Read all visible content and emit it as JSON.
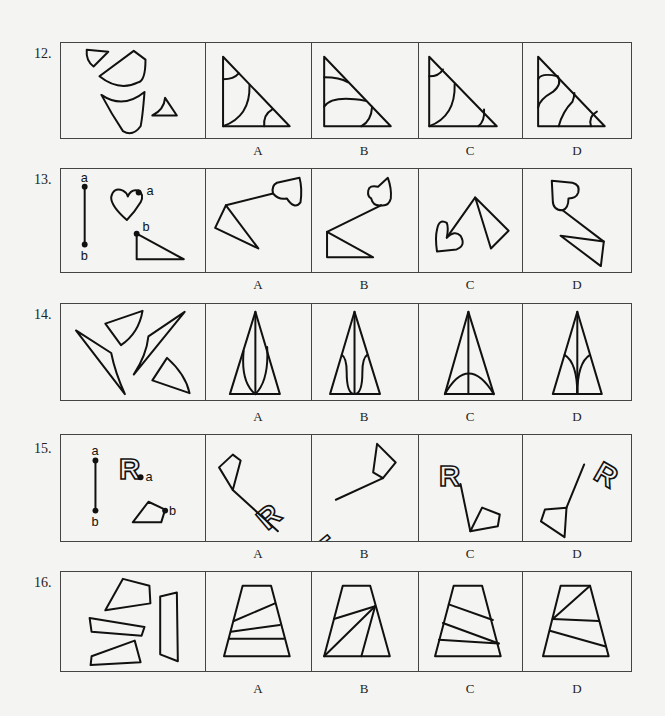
{
  "questions": [
    {
      "number": "12.",
      "options": [
        "A",
        "B",
        "C",
        "D"
      ]
    },
    {
      "number": "13.",
      "options": [
        "A",
        "B",
        "C",
        "D"
      ],
      "point_labels": {
        "top": "a",
        "bottom": "b",
        "heart": "a",
        "triangle": "b"
      }
    },
    {
      "number": "14.",
      "options": [
        "A",
        "B",
        "C",
        "D"
      ]
    },
    {
      "number": "15.",
      "options": [
        "A",
        "B",
        "C",
        "D"
      ],
      "point_labels": {
        "top": "a",
        "bottom": "b",
        "letter_point": "a",
        "pentagon_point": "b"
      },
      "letter": "R"
    },
    {
      "number": "16.",
      "options": [
        "A",
        "B",
        "C",
        "D"
      ]
    }
  ]
}
